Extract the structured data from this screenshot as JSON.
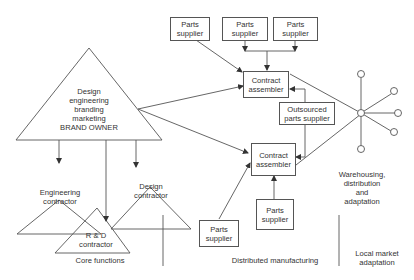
{
  "diagram": {
    "brand_owner": {
      "lines": [
        "Design",
        "engineering",
        "branding",
        "marketing",
        "BRAND OWNER"
      ]
    },
    "contractors": {
      "engineering": [
        "Engineering",
        "contractor"
      ],
      "design": [
        "Design",
        "contractor"
      ],
      "rd": [
        "R & D",
        "contractor"
      ]
    },
    "parts_supplier": [
      "Parts",
      "supplier"
    ],
    "contract_assembler": [
      "Contract",
      "assembler"
    ],
    "outsourced": [
      "Outsourced",
      "parts supplier"
    ],
    "warehousing": [
      "Warehousing,",
      "distribution",
      "and",
      "adaptation"
    ],
    "sections": {
      "core": "Core functions",
      "distributed": "Distributed manufacturing",
      "local": [
        "Local market",
        "adaptation"
      ]
    },
    "colors": {
      "line": "#444444",
      "text": "#333333",
      "background": "#ffffff"
    }
  }
}
